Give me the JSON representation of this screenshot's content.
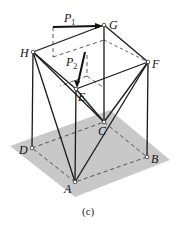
{
  "figure": {
    "caption": "(c)",
    "points": {
      "A": "A",
      "B": "B",
      "C": "C",
      "D": "D",
      "E": "E",
      "F": "F",
      "G": "G",
      "H": "H"
    },
    "forces": {
      "P1": {
        "letter": "P",
        "sub": "1"
      },
      "P2": {
        "letter": "P",
        "sub": "2"
      }
    },
    "colors": {
      "ground": "#c8c8c8",
      "line": "#1a1a1a"
    }
  }
}
